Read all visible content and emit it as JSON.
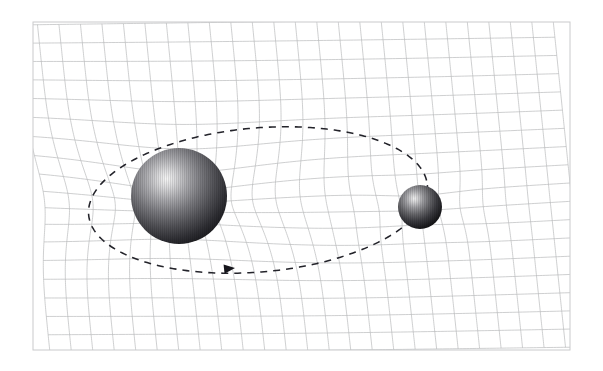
{
  "figure": {
    "kind": "gravity-well-grid-diagram",
    "background_color": "#ffffff"
  },
  "frame": {
    "name": "image-border",
    "x": 33,
    "y": 22,
    "width": 537,
    "height": 328,
    "stroke_color": "#c9cacc"
  },
  "grid": {
    "label": "spacetime-grid",
    "stroke_color": "#b9babc",
    "stroke_width": 0.7,
    "horizontal_lines": 19,
    "vertical_lines": 26,
    "description": "Rectangular mesh distorted (bent inward and compressed) by the gravitational well of the large mass"
  },
  "bodies": [
    {
      "name": "large-mass",
      "role": "central massive body",
      "center_x": 179,
      "center_y": 196,
      "radius": 48,
      "highlight_x": 167,
      "highlight_y": 183,
      "highlight_color": "#f6f6f6",
      "mid_color": "#6e6e72",
      "edge_color": "#131316"
    },
    {
      "name": "small-mass",
      "role": "orbiting body",
      "center_x": 420,
      "center_y": 207,
      "radius": 22,
      "highlight_x": 414,
      "highlight_y": 200,
      "highlight_color": "#f2f2f2",
      "mid_color": "#5d5d61",
      "edge_color": "#090909"
    }
  ],
  "orbit": {
    "name": "orbital-path",
    "style": "dashed ellipse",
    "stroke_color": "#23232a",
    "dash_pattern": "7 6",
    "center_x": 258,
    "center_y": 200,
    "radius_x": 170,
    "radius_y": 72,
    "rotation_deg": -5,
    "direction": "clockwise (arrow points right along the lower limb)",
    "arrow": {
      "name": "direction-arrow",
      "tip_x": 235,
      "tip_y": 268,
      "angle_deg": -6,
      "color": "#16161c"
    }
  },
  "chart_data": {
    "type": "diagram",
    "xlabel": "",
    "ylabel": "",
    "annotations": [
      "Large sphere sits in a deep well; grid lines converge toward it",
      "Smaller sphere orbits on the dashed elliptical path",
      "Arrow marks the direction of orbital motion"
    ]
  }
}
